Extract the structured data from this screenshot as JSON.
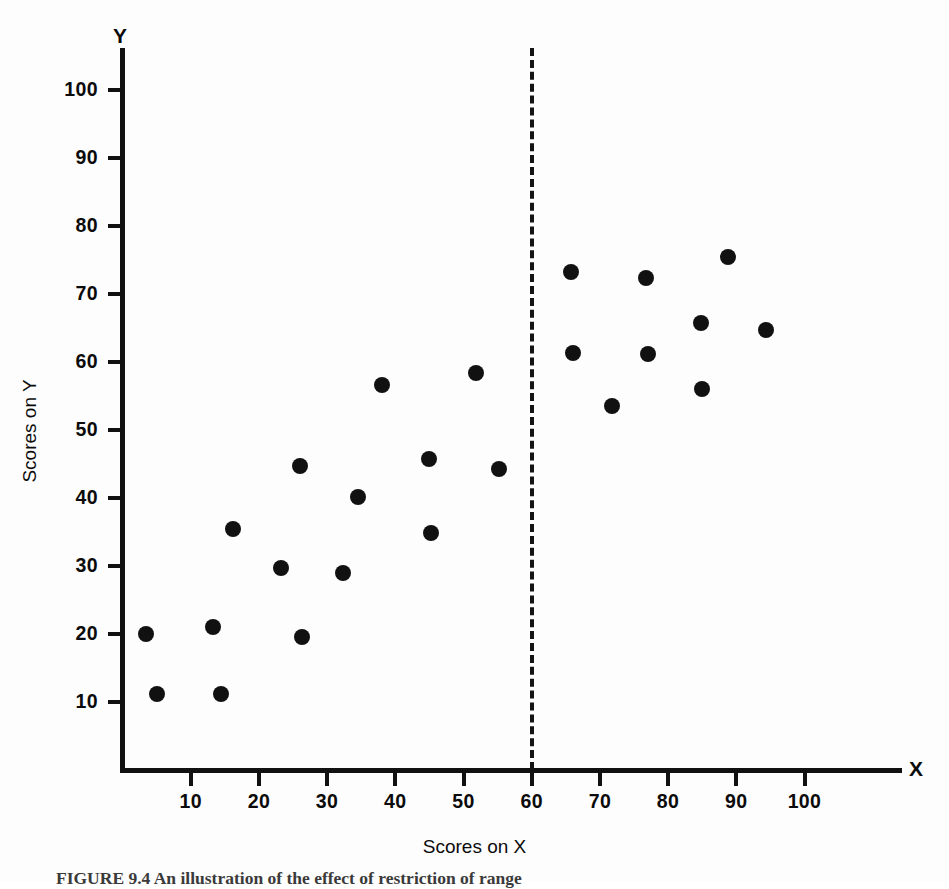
{
  "figure": {
    "caption": "FIGURE 9.4   An illustration of the effect of restriction of range"
  },
  "chart_data": {
    "type": "scatter",
    "title": "",
    "xlabel": "Scores on X",
    "ylabel": "Scores on Y",
    "x_axis_letter": "X",
    "y_axis_letter": "Y",
    "xlim": [
      0,
      110
    ],
    "ylim": [
      0,
      110
    ],
    "grid": false,
    "legend": "none",
    "xticks": [
      10,
      20,
      30,
      40,
      50,
      60,
      70,
      80,
      90,
      100
    ],
    "yticks": [
      10,
      20,
      30,
      40,
      50,
      60,
      70,
      80,
      90,
      100
    ],
    "xtick_labels": [
      "10",
      "20",
      "30",
      "40",
      "50",
      "60",
      "70",
      "80",
      "90",
      "100"
    ],
    "ytick_labels": [
      "10",
      "20",
      "30",
      "40",
      "50",
      "60",
      "70",
      "80",
      "90",
      "100"
    ],
    "annotations": [
      {
        "name": "restriction-cutoff-line",
        "type": "vertical-dashed-line",
        "x": 60,
        "style": "dashed",
        "color": "#141414"
      }
    ],
    "series": [
      {
        "name": "All scores",
        "marker": "filled-circle",
        "color": "#111111",
        "points": [
          {
            "x": 3.4,
            "y": 20.0
          },
          {
            "x": 5.0,
            "y": 11.2
          },
          {
            "x": 13.2,
            "y": 21.0
          },
          {
            "x": 14.4,
            "y": 11.2
          },
          {
            "x": 16.2,
            "y": 35.4
          },
          {
            "x": 23.2,
            "y": 29.7
          },
          {
            "x": 26.0,
            "y": 44.7
          },
          {
            "x": 26.3,
            "y": 19.6
          },
          {
            "x": 32.4,
            "y": 29.0
          },
          {
            "x": 34.6,
            "y": 40.2
          },
          {
            "x": 38.0,
            "y": 56.6
          },
          {
            "x": 45.0,
            "y": 45.7
          },
          {
            "x": 45.2,
            "y": 34.8
          },
          {
            "x": 51.8,
            "y": 58.4
          },
          {
            "x": 55.2,
            "y": 44.3
          },
          {
            "x": 65.8,
            "y": 73.3
          },
          {
            "x": 66.0,
            "y": 61.3
          },
          {
            "x": 71.8,
            "y": 53.6
          },
          {
            "x": 76.8,
            "y": 72.3
          },
          {
            "x": 77.0,
            "y": 61.2
          },
          {
            "x": 84.8,
            "y": 65.8
          },
          {
            "x": 85.0,
            "y": 56.1
          },
          {
            "x": 88.8,
            "y": 75.5
          },
          {
            "x": 94.4,
            "y": 64.7
          }
        ]
      }
    ],
    "groups": {
      "unrestricted_range_note": "All 24 points span X from about 3 to 95",
      "restricted_range_note": "Only points with X greater than 60 remain after restriction"
    }
  }
}
